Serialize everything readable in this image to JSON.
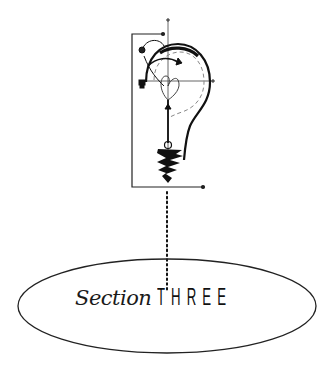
{
  "illustration": {
    "subject": "question-mark-lightbulb",
    "description": "Question mark shaped like a light bulb with a heart filament, enclosed in a bracket of axis lines"
  },
  "connector": {
    "style": "dotted-vertical-line"
  },
  "section_badge": {
    "script_word": "Section",
    "caps_word": "THREE",
    "shape": "ellipse"
  },
  "colors": {
    "ink": "#111111",
    "background": "#ffffff",
    "dashed": "#888888"
  }
}
